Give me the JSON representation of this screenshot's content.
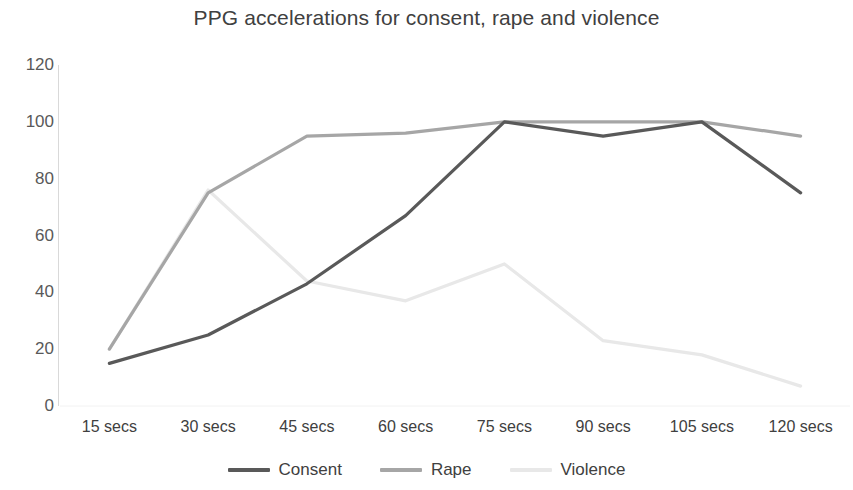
{
  "chart_data": {
    "type": "line",
    "title": "PPG accelerations for consent, rape and violence",
    "xlabel": "",
    "ylabel": "",
    "categories": [
      "15 secs",
      "30 secs",
      "45 secs",
      "60 secs",
      "75 secs",
      "90 secs",
      "105 secs",
      "120 secs"
    ],
    "yticks": [
      0,
      20,
      40,
      60,
      80,
      100,
      120
    ],
    "ylim": [
      0,
      120
    ],
    "grid": false,
    "legend_position": "bottom",
    "series": [
      {
        "name": "Consent",
        "color": "#595959",
        "values": [
          15,
          25,
          43,
          67,
          100,
          95,
          100,
          75
        ]
      },
      {
        "name": "Rape",
        "color": "#a6a6a6",
        "values": [
          20,
          75,
          95,
          96,
          100,
          100,
          100,
          95
        ]
      },
      {
        "name": "Violence",
        "color": "#e8e8e8",
        "values": [
          20,
          76,
          44,
          37,
          50,
          23,
          18,
          7
        ]
      }
    ]
  }
}
